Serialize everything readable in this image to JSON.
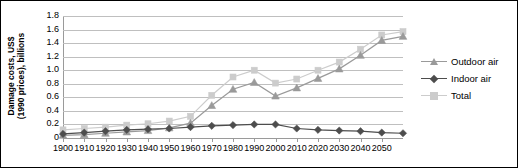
{
  "chart_data": {
    "type": "line",
    "title": "",
    "xlabel": "",
    "ylabel": "Damage costs, US$ (1990 prices), billions",
    "ylabel_lines": [
      "Damage costs, US$",
      "(1990 prices), billions"
    ],
    "xlim": [
      1900,
      2060
    ],
    "ylim": [
      0,
      1.8
    ],
    "grid": true,
    "legend_position": "right",
    "ytick_labels": [
      "1.8",
      "1.6",
      "1.4",
      "1.2",
      "1.0",
      "0.8",
      "0.6",
      "0.4",
      "0.2",
      "0"
    ],
    "ytick_values": [
      1.8,
      1.6,
      1.4,
      1.2,
      1.0,
      0.8,
      0.6,
      0.4,
      0.2,
      0
    ],
    "xtick_labels": [
      "1900",
      "1910",
      "1920",
      "1930",
      "1940",
      "1950",
      "1960",
      "1970",
      "1980",
      "1990",
      "2000",
      "2010",
      "2020",
      "2030",
      "2040",
      "2050"
    ],
    "x": [
      1900,
      1910,
      1920,
      1930,
      1940,
      1950,
      1960,
      1970,
      1980,
      1990,
      2000,
      2010,
      2020,
      2030,
      2040,
      2050,
      2060
    ],
    "series": [
      {
        "name": "Outdoor air",
        "marker": "triangle",
        "color": "#9a9a9a",
        "values": [
          0.04,
          0.05,
          0.07,
          0.09,
          0.11,
          0.15,
          0.22,
          0.48,
          0.72,
          0.82,
          0.62,
          0.74,
          0.88,
          1.02,
          1.22,
          1.44,
          1.5
        ]
      },
      {
        "name": "Indoor air",
        "marker": "diamond",
        "color": "#4d4d4d",
        "values": [
          0.06,
          0.08,
          0.1,
          0.12,
          0.13,
          0.14,
          0.16,
          0.18,
          0.19,
          0.2,
          0.2,
          0.14,
          0.12,
          0.11,
          0.1,
          0.08,
          0.07
        ]
      },
      {
        "name": "Total",
        "marker": "square",
        "color": "#cccccc",
        "values": [
          0.12,
          0.14,
          0.16,
          0.19,
          0.21,
          0.25,
          0.32,
          0.63,
          0.9,
          1.0,
          0.81,
          0.87,
          1.0,
          1.12,
          1.31,
          1.52,
          1.57
        ]
      }
    ]
  },
  "legend": {
    "items": [
      {
        "label": "Outdoor air"
      },
      {
        "label": "Indoor air"
      },
      {
        "label": "Total"
      }
    ]
  }
}
